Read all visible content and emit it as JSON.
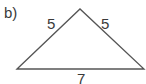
{
  "figure": {
    "part_label": "b)",
    "shape": "triangle",
    "triangle_type": "isosceles",
    "sides": {
      "left": "5",
      "right": "5",
      "base": "7"
    },
    "stroke_color": "#555555",
    "text_color": "#3a3a3a"
  }
}
